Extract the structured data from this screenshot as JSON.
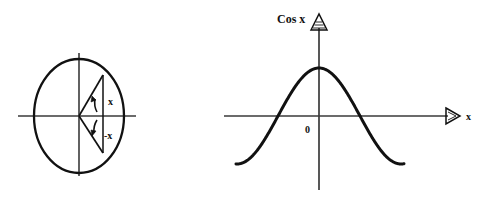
{
  "figure": {
    "title": "",
    "background_color": "#ffffff",
    "stroke_color": "#111111",
    "axis_color": "#3a3a3a"
  },
  "unit_circle": {
    "name": "unit-circle-diagram",
    "center": [
      79,
      116
    ],
    "radius_x": 45,
    "radius_y": 57,
    "axes": {
      "horizontal": [
        18,
        116,
        136,
        116
      ],
      "vertical": [
        79,
        53,
        79,
        176
      ]
    },
    "chord_x": 103,
    "upper_point": [
      103,
      75
    ],
    "lower_point": [
      103,
      153
    ],
    "labels": {
      "positive_angle": "x",
      "negative_angle": "-x"
    },
    "label_positions": {
      "positive_angle": [
        108,
        101
      ],
      "negative_angle": [
        106,
        135
      ]
    }
  },
  "cos_plot": {
    "name": "cosine-graph",
    "axis_label_y": "Cos x",
    "axis_label_x": "x",
    "origin_label": "0",
    "origin": [
      319,
      116
    ],
    "x_axis": [
      224,
      116,
      452,
      116
    ],
    "y_axis": [
      319,
      190,
      319,
      22
    ],
    "amplitude_px": 48,
    "half_period_px": 41,
    "curve_start_x": 236,
    "curve_end_x": 404
  },
  "chart_data": {
    "type": "line",
    "title": "",
    "xlabel": "x",
    "ylabel": "Cos x",
    "grid": false,
    "legend": null,
    "annotations": [
      "0"
    ],
    "xlim": [
      -2.02,
      2.08
    ],
    "ylim": [
      -1.25,
      1.35
    ],
    "series": [
      {
        "name": "Cos x",
        "function": "cos(pi*x)",
        "x": [
          -2.02,
          -1.9,
          -1.8,
          -1.7,
          -1.6,
          -1.5,
          -1.4,
          -1.3,
          -1.2,
          -1.1,
          -1.0,
          -0.9,
          -0.8,
          -0.7,
          -0.6,
          -0.5,
          -0.4,
          -0.3,
          -0.2,
          -0.1,
          0.0,
          0.1,
          0.2,
          0.3,
          0.4,
          0.5,
          0.6,
          0.7,
          0.8,
          0.9,
          1.0,
          1.1,
          1.2,
          1.3,
          1.4,
          1.5,
          1.6,
          1.7,
          1.8,
          1.9,
          2.02
        ],
        "values": [
          0.998,
          0.951,
          0.809,
          0.588,
          0.309,
          0.0,
          -0.309,
          -0.588,
          -0.809,
          -0.951,
          -1.0,
          -0.951,
          -0.809,
          -0.588,
          -0.309,
          0.0,
          0.309,
          0.588,
          0.809,
          0.951,
          1.0,
          0.951,
          0.809,
          0.588,
          0.309,
          0.0,
          -0.309,
          -0.588,
          -0.809,
          -0.951,
          -1.0,
          -0.951,
          -0.809,
          -0.588,
          -0.309,
          0.0,
          0.309,
          0.588,
          0.809,
          0.951,
          0.998
        ],
        "maxima_x": [
          -2.0,
          0.0,
          2.0
        ],
        "minima_x": [
          -1.0,
          1.0
        ],
        "zero_crossings_x": [
          -1.5,
          -0.5,
          0.5,
          1.5
        ]
      }
    ]
  }
}
